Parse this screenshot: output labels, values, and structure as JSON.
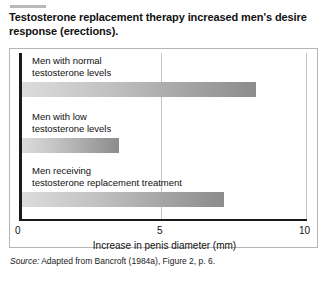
{
  "figure": {
    "title": "Testosterone replacement therapy increased men's desire response (erections).",
    "source_label": "Source:",
    "source_text": " Adapted from Bancroft (1984a), Figure 2, p. 6."
  },
  "chart_data": {
    "type": "bar",
    "orientation": "horizontal",
    "title": "Testosterone replacement therapy increased men's desire response (erections).",
    "categories": [
      "Men with normal\ntestosterone levels",
      "Men with low\ntestosterone levels",
      "Men receiving\ntestosterone replacement treatment"
    ],
    "values": [
      8.2,
      3.4,
      7.1
    ],
    "xlabel": "Increase in penis diameter (mm)",
    "ylabel": "",
    "xlim": [
      0,
      10
    ],
    "xticks": [
      "0",
      "5",
      "10"
    ],
    "xtick_values": [
      0,
      5,
      10
    ],
    "grid": true,
    "grid_axis": "x",
    "legend": false,
    "bar_fill": "linear-gradient light-gray to dark-gray",
    "bar_color_start": "#dcdcdc",
    "bar_color_end": "#8c8c8c",
    "axis_color": "#1a1a1a",
    "gridline_color": "#c4c4c4",
    "frame_color": "#b5b5b5"
  }
}
